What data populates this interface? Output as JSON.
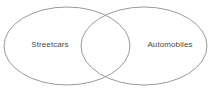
{
  "canvas": {
    "width": 212,
    "height": 89,
    "background": "#ffffff"
  },
  "caption": {
    "text": "bodies",
    "note_clipped": "true"
  },
  "diagram": {
    "type": "venn-2-set",
    "stroke_color": "#9a9a9a",
    "fill_color": "none",
    "label_color": "#4a4a4a",
    "left_set": {
      "label": "Streetcars",
      "cx": 67,
      "cy": 46,
      "rx": 63,
      "ry": 39,
      "label_x": 50,
      "label_y": 45
    },
    "right_set": {
      "label": "Automobiles",
      "cx": 144,
      "cy": 46,
      "rx": 63,
      "ry": 39,
      "label_x": 170,
      "label_y": 45
    },
    "intersection": {
      "label": "",
      "x_start": 80,
      "x_end": 130,
      "top_crossing_y": 13,
      "bottom_crossing_y": 80
    }
  }
}
